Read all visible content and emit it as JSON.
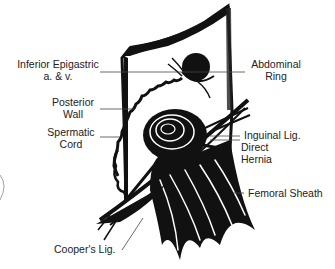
{
  "figure": {
    "labels": {
      "inferior_epigastric_line1": "Inferior Epigastric",
      "inferior_epigastric_line2": "a. & v.",
      "posterior_wall_line1": "Posterior",
      "posterior_wall_line2": "Wall",
      "spermatic_cord_line1": "Spermatic",
      "spermatic_cord_line2": "Cord",
      "coopers_lig": "Cooper's Lig.",
      "abdominal_ring_line1": "Abdominal",
      "abdominal_ring_line2": "Ring",
      "inguinal_lig": "Inguinal Lig.",
      "direct_hernia_line1": "Direct",
      "direct_hernia_line2": "Hernia",
      "femoral_sheath": "Femoral Sheath"
    },
    "colors": {
      "ink": "#111111",
      "leader_line": "#444444",
      "background": "#ffffff"
    }
  }
}
